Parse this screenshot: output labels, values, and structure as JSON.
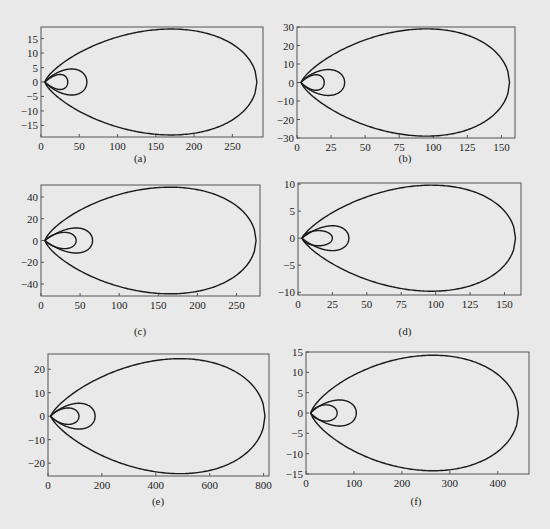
{
  "chart_data": [
    {
      "id": "a",
      "type": "line",
      "caption": "(a)",
      "title": "",
      "xlabel": "",
      "ylabel": "",
      "xlim": [
        0,
        290
      ],
      "ylim": [
        -19,
        19
      ],
      "xticks": [
        0,
        50,
        100,
        150,
        200,
        250
      ],
      "yticks": [
        -15,
        -10,
        -5,
        0,
        5,
        10,
        15
      ],
      "grid": false,
      "frame_px": {
        "left": 41,
        "top": 27,
        "right": 263,
        "bottom": 137
      },
      "series": [
        {
          "name": "inner-loop",
          "tip_x": 5,
          "max_x": 35,
          "peak_x": 25,
          "peak_y": 2.6
        },
        {
          "name": "middle-loop",
          "tip_x": 5,
          "max_x": 60,
          "peak_x": 40,
          "peak_y": 4.5
        },
        {
          "name": "outer-loop",
          "tip_x": 5,
          "max_x": 282,
          "peak_x": 170,
          "peak_y": 18.3
        }
      ]
    },
    {
      "id": "b",
      "type": "line",
      "caption": "(b)",
      "title": "",
      "xlabel": "",
      "ylabel": "",
      "xlim": [
        0,
        160
      ],
      "ylim": [
        -30,
        30
      ],
      "xticks": [
        0,
        25,
        50,
        75,
        100,
        125,
        150
      ],
      "yticks": [
        -30,
        -20,
        -10,
        0,
        10,
        20,
        30
      ],
      "grid": false,
      "frame_px": {
        "left": 297,
        "top": 27,
        "right": 515,
        "bottom": 138
      },
      "series": [
        {
          "name": "inner-loop",
          "tip_x": 3,
          "max_x": 20,
          "peak_x": 14,
          "peak_y": 4.2
        },
        {
          "name": "middle-loop",
          "tip_x": 3,
          "max_x": 35,
          "peak_x": 23,
          "peak_y": 7
        },
        {
          "name": "outer-loop",
          "tip_x": 3,
          "max_x": 156,
          "peak_x": 95,
          "peak_y": 29
        }
      ]
    },
    {
      "id": "c",
      "type": "line",
      "caption": "(c)",
      "title": "",
      "xlabel": "",
      "ylabel": "",
      "xlim": [
        0,
        280
      ],
      "ylim": [
        -51,
        51
      ],
      "xticks": [
        0,
        50,
        100,
        150,
        200,
        250
      ],
      "yticks": [
        -40,
        -20,
        0,
        20,
        40
      ],
      "grid": false,
      "frame_px": {
        "left": 41,
        "top": 185,
        "right": 260,
        "bottom": 296
      },
      "series": [
        {
          "name": "inner-loop",
          "tip_x": 5,
          "max_x": 45,
          "peak_x": 30,
          "peak_y": 7.5
        },
        {
          "name": "middle-loop",
          "tip_x": 5,
          "max_x": 66,
          "peak_x": 45,
          "peak_y": 11.5
        },
        {
          "name": "outer-loop",
          "tip_x": 5,
          "max_x": 275,
          "peak_x": 165,
          "peak_y": 49
        }
      ]
    },
    {
      "id": "d",
      "type": "line",
      "caption": "(d)",
      "title": "",
      "xlabel": "",
      "ylabel": "",
      "xlim": [
        0,
        162
      ],
      "ylim": [
        -10.5,
        10.2
      ],
      "xticks": [
        0,
        25,
        50,
        75,
        100,
        125,
        150
      ],
      "yticks": [
        -10,
        -5,
        0,
        5,
        10
      ],
      "grid": false,
      "frame_px": {
        "left": 298,
        "top": 183,
        "right": 521,
        "bottom": 295
      },
      "series": [
        {
          "name": "inner-loop",
          "tip_x": 3,
          "max_x": 25,
          "peak_x": 15,
          "peak_y": 1.4
        },
        {
          "name": "middle-loop",
          "tip_x": 3,
          "max_x": 37,
          "peak_x": 25,
          "peak_y": 2.3
        },
        {
          "name": "outer-loop",
          "tip_x": 3,
          "max_x": 158,
          "peak_x": 97,
          "peak_y": 9.8
        }
      ]
    },
    {
      "id": "e",
      "type": "line",
      "caption": "(e)",
      "title": "",
      "xlabel": "",
      "ylabel": "",
      "xlim": [
        0,
        820
      ],
      "ylim": [
        -25.5,
        26.5
      ],
      "xticks": [
        0,
        200,
        400,
        600,
        800
      ],
      "yticks": [
        -20,
        -10,
        0,
        10,
        20
      ],
      "grid": false,
      "frame_px": {
        "left": 48,
        "top": 354,
        "right": 269,
        "bottom": 476
      },
      "series": [
        {
          "name": "inner-loop",
          "tip_x": 10,
          "max_x": 115,
          "peak_x": 75,
          "peak_y": 3.5
        },
        {
          "name": "middle-loop",
          "tip_x": 10,
          "max_x": 175,
          "peak_x": 115,
          "peak_y": 5.5
        },
        {
          "name": "outer-loop",
          "tip_x": 10,
          "max_x": 805,
          "peak_x": 490,
          "peak_y": 24.5
        }
      ]
    },
    {
      "id": "f",
      "type": "line",
      "caption": "(f)",
      "title": "",
      "xlabel": "",
      "ylabel": "",
      "xlim": [
        0,
        465
      ],
      "ylim": [
        -15,
        15
      ],
      "xticks": [
        0,
        100,
        200,
        300,
        400
      ],
      "yticks": [
        -15,
        -10,
        -5,
        0,
        5,
        10,
        15
      ],
      "grid": false,
      "frame_px": {
        "left": 306,
        "top": 352,
        "right": 529,
        "bottom": 474
      },
      "series": [
        {
          "name": "inner-loop",
          "tip_x": 10,
          "max_x": 65,
          "peak_x": 42,
          "peak_y": 2
        },
        {
          "name": "middle-loop",
          "tip_x": 10,
          "max_x": 105,
          "peak_x": 70,
          "peak_y": 3.2
        },
        {
          "name": "outer-loop",
          "tip_x": 10,
          "max_x": 443,
          "peak_x": 265,
          "peak_y": 14.2
        }
      ]
    }
  ],
  "captions_px": {
    "a": {
      "x": 140,
      "y": 162
    },
    "b": {
      "x": 405,
      "y": 162
    },
    "c": {
      "x": 140,
      "y": 335
    },
    "d": {
      "x": 405,
      "y": 335
    },
    "e": {
      "x": 158,
      "y": 505
    },
    "f": {
      "x": 416,
      "y": 505
    }
  },
  "style": {
    "line_color": "#1a1a1a",
    "frame_color": "#555555",
    "background": "#e9e9e9"
  }
}
